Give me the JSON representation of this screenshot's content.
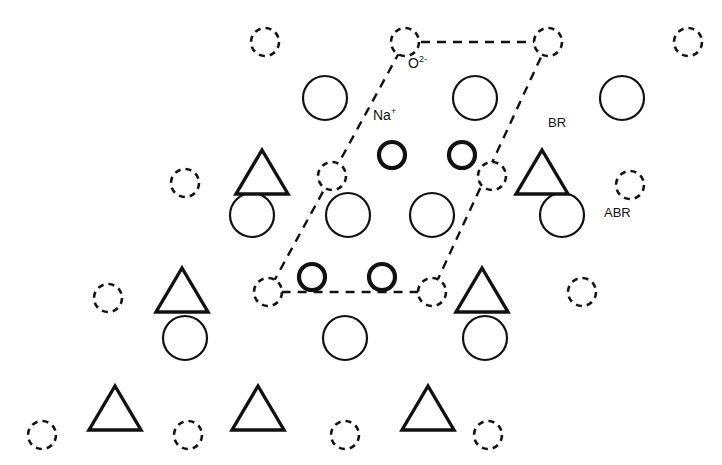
{
  "figure": {
    "background_color": "#ffffff",
    "line_color": "#111111",
    "width": 722,
    "height": 465
  },
  "labels": {
    "oxygen": {
      "text": "O",
      "charge": "2-",
      "x": 408,
      "y": 56
    },
    "sodium": {
      "text": "Na",
      "charge": "+",
      "x": 373,
      "y": 108
    },
    "br": {
      "text": "BR",
      "x": 548,
      "y": 116
    },
    "abr": {
      "text": "ABR",
      "x": 604,
      "y": 206
    }
  },
  "legend_meaning": {
    "large_thin_circle": "O2-",
    "bold_medium_circle": "Na+",
    "triangle": "BR",
    "dashed_circle": "ABR"
  },
  "unit_cell": {
    "name": "unit-cell-parallelogram",
    "stroke_color": "#111111",
    "stroke_width": 2.4,
    "dash": "9 7",
    "vertices": [
      {
        "x": 405,
        "y": 42
      },
      {
        "x": 548,
        "y": 42
      },
      {
        "x": 432,
        "y": 292
      },
      {
        "x": 268,
        "y": 292
      }
    ]
  },
  "shapes": {
    "large_circles": {
      "name": "oxygen-site",
      "radius": 22,
      "stroke_width": 2.2,
      "items": [
        {
          "x": 325,
          "y": 98
        },
        {
          "x": 475,
          "y": 98
        },
        {
          "x": 622,
          "y": 98
        },
        {
          "x": 252,
          "y": 215
        },
        {
          "x": 348,
          "y": 215
        },
        {
          "x": 432,
          "y": 215
        },
        {
          "x": 562,
          "y": 215
        },
        {
          "x": 185,
          "y": 338
        },
        {
          "x": 345,
          "y": 338
        },
        {
          "x": 485,
          "y": 338
        }
      ]
    },
    "bold_circles": {
      "name": "sodium-ion",
      "radius": 13,
      "stroke_width": 4.2,
      "items": [
        {
          "x": 392,
          "y": 155
        },
        {
          "x": 462,
          "y": 155
        },
        {
          "x": 312,
          "y": 277
        },
        {
          "x": 382,
          "y": 277
        }
      ]
    },
    "dashed_circles": {
      "name": "abr-site",
      "radius": 14,
      "stroke_width": 2.6,
      "dash": "6 5",
      "items": [
        {
          "x": 265,
          "y": 42
        },
        {
          "x": 405,
          "y": 42
        },
        {
          "x": 548,
          "y": 42
        },
        {
          "x": 688,
          "y": 42
        },
        {
          "x": 185,
          "y": 183
        },
        {
          "x": 332,
          "y": 176
        },
        {
          "x": 492,
          "y": 176
        },
        {
          "x": 630,
          "y": 185
        },
        {
          "x": 108,
          "y": 298
        },
        {
          "x": 268,
          "y": 292
        },
        {
          "x": 432,
          "y": 292
        },
        {
          "x": 582,
          "y": 292
        },
        {
          "x": 42,
          "y": 435
        },
        {
          "x": 188,
          "y": 435
        },
        {
          "x": 345,
          "y": 435
        },
        {
          "x": 488,
          "y": 435
        }
      ]
    },
    "triangles": {
      "name": "br-site",
      "half_width": 26,
      "height": 44,
      "stroke_width": 3.4,
      "items": [
        {
          "x": 262,
          "y": 172
        },
        {
          "x": 542,
          "y": 172
        },
        {
          "x": 182,
          "y": 290
        },
        {
          "x": 482,
          "y": 290
        },
        {
          "x": 115,
          "y": 408
        },
        {
          "x": 258,
          "y": 408
        },
        {
          "x": 428,
          "y": 408
        }
      ]
    }
  }
}
